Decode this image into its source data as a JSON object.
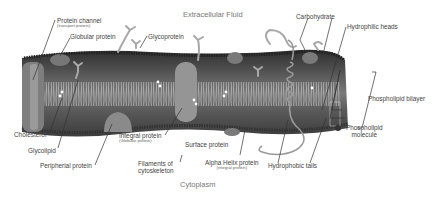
{
  "regions": {
    "top": "Extracellular Fluid",
    "bottom": "Cytoplasm"
  },
  "labels": {
    "protein_channel": {
      "main": "Protein channel",
      "sub": "(transport protein)"
    },
    "globular_protein": "Globular protein",
    "glycoprotein": "Glycoprotein",
    "carbohydrate": "Carbohydrate",
    "hydrophilic_heads": "Hydrophilic heads",
    "phospholipid_bilayer": "Phospholipid bilayer",
    "phospholipid_molecule": {
      "line1": "Phospholipid",
      "line2": "molecule"
    },
    "cholesterol": "Cholesterol",
    "glycolipid": "Glycolipid",
    "peripheral_protein": "Peripherial protein",
    "integral_protein": {
      "main": "Integral protein",
      "sub": "(Globular protein)"
    },
    "surface_protein": "Surface protein",
    "filaments": {
      "line1": "Filaments of",
      "line2": "cytoskeleton"
    },
    "alpha_helix": {
      "main": "Alpha Helix protein",
      "sub": "(integral protein)"
    },
    "hydrophobic_tails": "Hydrophobic tails"
  },
  "colors": {
    "membrane_dark": "#3a3a3a",
    "membrane_mid": "#6a6a6a",
    "protein": "#8c8c8c",
    "carbohydrate": "#a8a8a8",
    "tails": "#c8c8c8",
    "text": "#444444"
  }
}
